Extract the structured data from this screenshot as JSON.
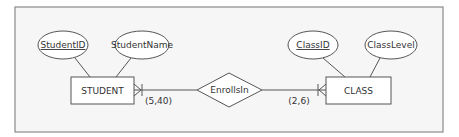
{
  "diagram": {
    "type": "entity-relationship",
    "colors": {
      "stroke": "#555555",
      "frame": "#8a8a8a",
      "panel": "#f6f6f6",
      "text": "#333333"
    },
    "entities": [
      {
        "name": "STUDENT",
        "attributes": [
          {
            "label": "StudentID",
            "key": true
          },
          {
            "label": "StudentName",
            "key": false
          }
        ]
      },
      {
        "name": "CLASS",
        "attributes": [
          {
            "label": "ClassID",
            "key": true
          },
          {
            "label": "ClassLevel",
            "key": false
          }
        ]
      }
    ],
    "relationship": {
      "name": "EnrollsIn"
    },
    "cardinalities": {
      "student_side": "(5,40)",
      "class_side": "(2,6)"
    }
  }
}
